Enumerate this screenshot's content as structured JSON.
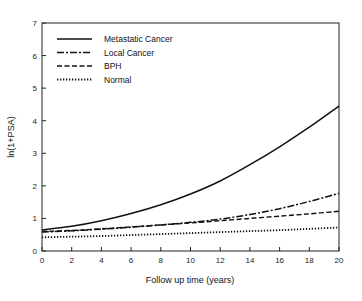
{
  "chart_data": {
    "type": "line",
    "title": "",
    "xlabel": "Follow up time (years)",
    "ylabel": "ln(1+PSA)",
    "xlim": [
      0,
      20
    ],
    "ylim": [
      0,
      7
    ],
    "xticks": [
      0,
      2,
      4,
      6,
      8,
      10,
      12,
      14,
      16,
      18,
      20
    ],
    "yticks": [
      0,
      1,
      2,
      3,
      4,
      5,
      6,
      7
    ],
    "grid": false,
    "legend_position": "upper left",
    "x": [
      0,
      2,
      4,
      6,
      8,
      10,
      12,
      14,
      16,
      18,
      20
    ],
    "series": [
      {
        "name": "Metastatic Cancer",
        "style": "solid",
        "values": [
          0.65,
          0.76,
          0.93,
          1.15,
          1.42,
          1.75,
          2.15,
          2.65,
          3.2,
          3.8,
          4.45
        ]
      },
      {
        "name": "Local Cancer",
        "style": "dashdot",
        "values": [
          0.58,
          0.62,
          0.67,
          0.73,
          0.8,
          0.88,
          0.98,
          1.12,
          1.3,
          1.52,
          1.77
        ]
      },
      {
        "name": "BPH",
        "style": "dashed",
        "values": [
          0.6,
          0.63,
          0.68,
          0.74,
          0.8,
          0.86,
          0.93,
          1.0,
          1.07,
          1.14,
          1.22
        ]
      },
      {
        "name": "Normal",
        "style": "dotted",
        "values": [
          0.42,
          0.44,
          0.46,
          0.49,
          0.52,
          0.55,
          0.58,
          0.61,
          0.64,
          0.68,
          0.72
        ]
      }
    ]
  }
}
